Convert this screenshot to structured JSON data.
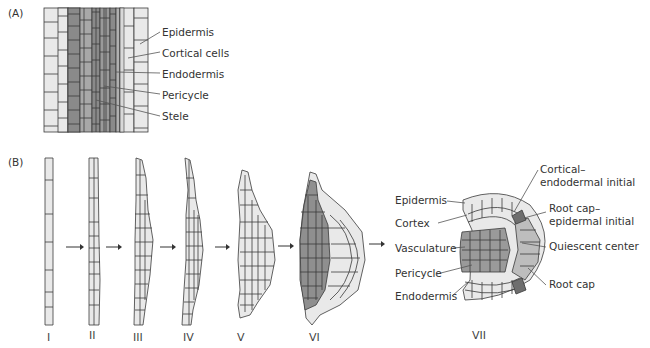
{
  "figure": {
    "panel_a": {
      "label": "(A)",
      "labels": [
        "Epidermis",
        "Cortical cells",
        "Endodermis",
        "Pericycle",
        "Stele"
      ]
    },
    "panel_b": {
      "label": "(B)",
      "stages": [
        "I",
        "II",
        "III",
        "IV",
        "V",
        "VI",
        "VII"
      ],
      "left_labels": [
        "Epidermis",
        "Cortex",
        "Vasculature",
        "Pericycle",
        "Endodermis"
      ],
      "right_labels": [
        {
          "line1": "Cortical–",
          "line2": "endodermal initial"
        },
        {
          "line1": "Root cap–",
          "line2": "epidermal initial"
        },
        {
          "line1": "Quiescent center",
          "line2": ""
        },
        {
          "line1": "Root cap",
          "line2": ""
        }
      ]
    },
    "colors": {
      "light_cell": "#e9e9e9",
      "medium_cell": "#b4b4b4",
      "dark_cell": "#8f8f8f",
      "outline": "#3a3a3a"
    }
  }
}
